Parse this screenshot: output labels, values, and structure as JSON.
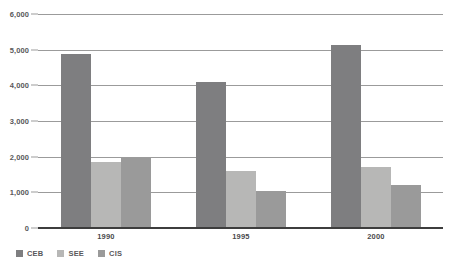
{
  "chart_data": {
    "type": "bar",
    "title": "",
    "xlabel": "",
    "ylabel": "",
    "categories": [
      "1990",
      "1995",
      "2000"
    ],
    "series": [
      {
        "name": "CEB",
        "color": "#7e7e80",
        "values": [
          4870,
          4100,
          5120
        ]
      },
      {
        "name": "SEE",
        "color": "#b7b7b6",
        "values": [
          1850,
          1600,
          1700
        ]
      },
      {
        "name": "CIS",
        "color": "#9a9a9a",
        "values": [
          1960,
          1030,
          1200
        ]
      }
    ],
    "ylim": [
      0,
      6000
    ],
    "ytick_step": 1000,
    "ytick_labels": [
      "6,000",
      "5,000",
      "4,000",
      "3,000",
      "2,000",
      "1,000",
      "0"
    ],
    "ytick_values": [
      6000,
      5000,
      4000,
      3000,
      2000,
      1000,
      0
    ],
    "grid": true,
    "grid_axis": "y",
    "legend_position": "bottom-left"
  },
  "axis": {
    "y": {
      "ticks": [
        {
          "label": "6,000",
          "value": 6000
        },
        {
          "label": "5,000",
          "value": 5000
        },
        {
          "label": "4,000",
          "value": 4000
        },
        {
          "label": "3,000",
          "value": 3000
        },
        {
          "label": "2,000",
          "value": 2000
        },
        {
          "label": "1,000",
          "value": 1000
        },
        {
          "label": "0",
          "value": 0
        }
      ]
    },
    "x": {
      "ticks": [
        {
          "label": "1990"
        },
        {
          "label": "1995"
        },
        {
          "label": "2000"
        }
      ]
    }
  },
  "legend": {
    "items": [
      {
        "label": "CEB",
        "color": "#7e7e80"
      },
      {
        "label": "SEE",
        "color": "#b7b7b6"
      },
      {
        "label": "CIS",
        "color": "#9a9a9a"
      }
    ]
  }
}
